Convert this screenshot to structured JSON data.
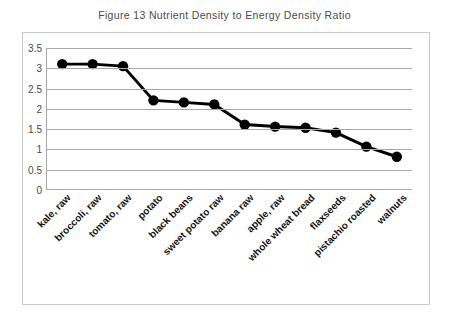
{
  "chart_data": {
    "type": "line",
    "title": "Figure 13 Nutrient Density to Energy Density Ratio",
    "xlabel": "",
    "ylabel": "",
    "ylim": [
      0,
      3.5
    ],
    "yticks": [
      "3.5",
      "3",
      "2.5",
      "2",
      "1.5",
      "1",
      "0.5",
      "0"
    ],
    "ytick_values": [
      3.5,
      3,
      2.5,
      2,
      1.5,
      1,
      0.5,
      0
    ],
    "grid": true,
    "legend": false,
    "marker": "filled-circle",
    "line_color": "#000000",
    "marker_color": "#000000",
    "grid_color": "#a8a8a8",
    "categories": [
      "kale, raw",
      "broccoli, raw",
      "tomato, raw",
      "potato",
      "black beans",
      "sweet potato raw",
      "banana raw",
      "apple, raw",
      "whole wheat bread",
      "flaxseeds",
      "pistachio roasted",
      "walnuts"
    ],
    "values": [
      3.1,
      3.1,
      3.05,
      2.2,
      2.15,
      2.1,
      1.6,
      1.55,
      1.52,
      1.4,
      1.05,
      0.8
    ]
  }
}
